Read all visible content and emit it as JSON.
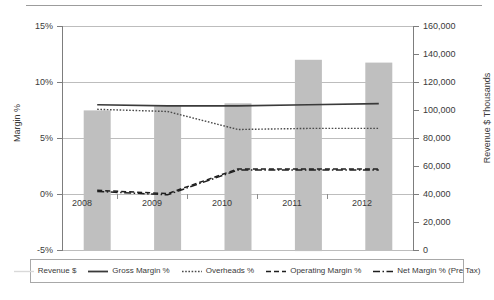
{
  "chart_data": {
    "type": "bar",
    "title": "",
    "subtitle": "",
    "categories": [
      "2008",
      "2009",
      "2010",
      "2011",
      "2012"
    ],
    "xlabel": "",
    "grid": true,
    "legend_position": "bottom",
    "axes": {
      "left": {
        "label": "Margin %",
        "ticks": [
          "-5%",
          "0%",
          "5%",
          "10%",
          "15%"
        ],
        "tick_values": [
          -5,
          0,
          5,
          10,
          15
        ],
        "lim": [
          -5,
          15
        ]
      },
      "right": {
        "label": "Revenue $ Thousands",
        "ticks": [
          "0",
          "20,000",
          "40,000",
          "60,000",
          "80,000",
          "100,000",
          "120,000",
          "140,000",
          "160,000"
        ],
        "tick_values": [
          0,
          20000,
          40000,
          60000,
          80000,
          100000,
          120000,
          140000,
          160000
        ],
        "lim": [
          0,
          160000
        ]
      }
    },
    "series": [
      {
        "name": "Revenue $",
        "type": "bar",
        "axis": "right",
        "color": "#bfbfbf",
        "values": [
          100000,
          103000,
          105000,
          136000,
          134000
        ]
      },
      {
        "name": "Gross Margin %",
        "type": "line",
        "axis": "left",
        "color": "#3a3a3a",
        "style": "solid",
        "values": [
          8.0,
          7.9,
          7.9,
          8.0,
          8.1
        ]
      },
      {
        "name": "Overheads %",
        "type": "line",
        "axis": "left",
        "color": "#3a3a3a",
        "style": "dotted",
        "values": [
          7.6,
          7.4,
          5.8,
          5.9,
          5.9
        ]
      },
      {
        "name": "Operating Margin %",
        "type": "line",
        "axis": "left",
        "color": "#1f1f1f",
        "style": "dashed",
        "values": [
          0.4,
          0.1,
          2.3,
          2.3,
          2.3
        ]
      },
      {
        "name": "Net Margin % (Pre Tax)",
        "type": "line",
        "axis": "left",
        "color": "#1f1f1f",
        "style": "dashdot",
        "values": [
          0.3,
          0.0,
          2.2,
          2.2,
          2.2
        ]
      }
    ]
  },
  "legend": {
    "items": [
      {
        "label": "Revenue $",
        "swatch": "legend-swatch-revenue"
      },
      {
        "label": "Gross Margin %",
        "swatch": "legend-swatch-gross-margin"
      },
      {
        "label": "Overheads %",
        "swatch": "legend-swatch-overheads"
      },
      {
        "label": "Operating Margin %",
        "swatch": "legend-swatch-operating-margin"
      },
      {
        "label": "Net Margin % (Pre Tax)",
        "swatch": "legend-swatch-net-margin"
      }
    ]
  },
  "colors": {
    "bar": "#bfbfbf",
    "line_dark": "#3a3a3a",
    "line_black": "#1f1f1f",
    "grid": "#bdbdbd",
    "axis": "#7d7d7d",
    "legend_border": "#a8a8a8",
    "revenue_legend_line": "#d9d9d9"
  }
}
